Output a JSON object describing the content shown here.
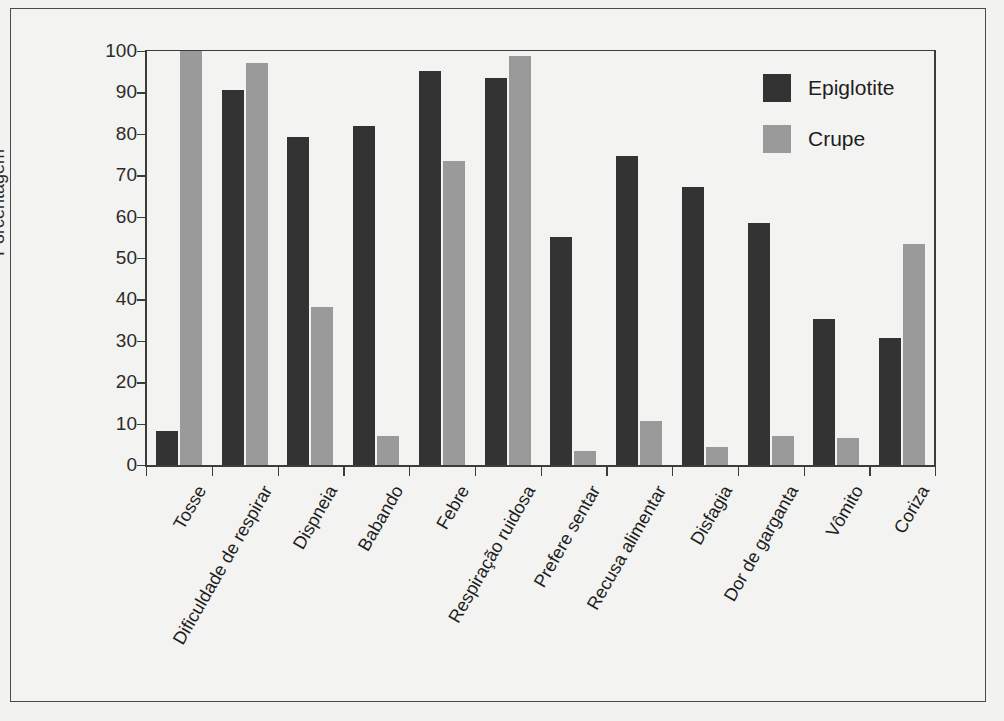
{
  "chart_data": {
    "type": "bar",
    "title": "",
    "xlabel": "",
    "ylabel": "Porcentagem",
    "ylim": [
      0,
      100
    ],
    "yticks": [
      0,
      10,
      20,
      30,
      40,
      50,
      60,
      70,
      80,
      90,
      100
    ],
    "grid": false,
    "legend_position": "top-right",
    "categories": [
      "Tosse",
      "Dificuldade de respirar",
      "Dispneia",
      "Babando",
      "Febre",
      "Respiração ruidosa",
      "Prefere sentar",
      "Recusa alimentar",
      "Disfagia",
      "Dor de garganta",
      "Vômito",
      "Coriza"
    ],
    "series": [
      {
        "name": "Epiglotite",
        "color": "#333333",
        "values": [
          8.2,
          90.5,
          79.2,
          82.0,
          95.2,
          93.4,
          55.1,
          74.6,
          67.2,
          58.4,
          35.2,
          30.8
        ]
      },
      {
        "name": "Crupe",
        "color": "#9a9a9a",
        "values": [
          100.0,
          97.0,
          38.2,
          6.9,
          73.5,
          98.8,
          3.4,
          10.6,
          4.4,
          7.0,
          6.6,
          53.4
        ]
      }
    ]
  }
}
